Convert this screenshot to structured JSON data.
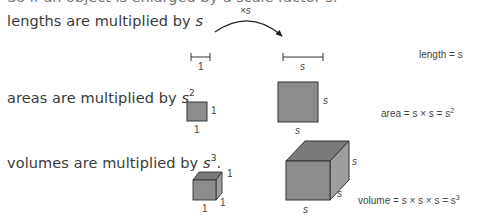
{
  "intro_cut": "So if an object is enlarged by a scale factor s:",
  "rows": {
    "length": {
      "statement": "lengths are multiplied by s",
      "statement_base": "lengths are multiplied by ",
      "statement_var": "s",
      "small_label": "1",
      "large_label": "s",
      "arrow_label": "×s",
      "formula": "length = s"
    },
    "area": {
      "statement_base": "areas are multiplied by ",
      "statement_var": "s",
      "statement_exp": "2",
      "small_side_label": "1",
      "small_bottom_label": "1",
      "large_side_label": "s",
      "large_bottom_label": "s",
      "formula_base": "area = s × s = s",
      "formula_exp": "2"
    },
    "volume": {
      "statement_base": "volumes are multiplied by ",
      "statement_var": "s",
      "statement_exp": "3",
      "statement_end": ".",
      "small_labels": [
        "1",
        "1",
        "1"
      ],
      "large_labels": [
        "s",
        "s",
        "s"
      ],
      "formula_base": "volume = s × s × s = s",
      "formula_exp": "3"
    }
  },
  "colors": {
    "fill_front": "#8c8c8c",
    "fill_top": "#7a7a7a",
    "fill_side": "#9a9a9a",
    "stroke": "#333333"
  }
}
